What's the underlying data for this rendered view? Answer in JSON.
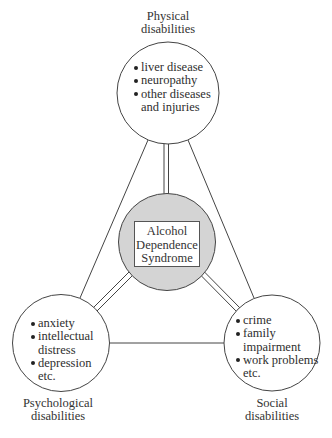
{
  "diagram": {
    "type": "relationship-diagram",
    "center": {
      "label_lines": [
        "Alcohol",
        "Dependence",
        "Syndrome"
      ],
      "fill_color": "#d4d4d4"
    },
    "nodes": [
      {
        "id": "physical",
        "title_lines": [
          "Physical",
          "disabilities"
        ],
        "items": [
          {
            "bullet": true,
            "text": "liver disease"
          },
          {
            "bullet": true,
            "text": "neuropathy"
          },
          {
            "bullet": true,
            "text": "other diseases"
          },
          {
            "bullet": false,
            "text": "and injuries"
          }
        ]
      },
      {
        "id": "psychological",
        "title_lines": [
          "Psychological",
          "disabilities"
        ],
        "items": [
          {
            "bullet": true,
            "text": "anxiety"
          },
          {
            "bullet": true,
            "text": "intellectual"
          },
          {
            "bullet": false,
            "text": "distress"
          },
          {
            "bullet": true,
            "text": "depression"
          },
          {
            "bullet": false,
            "text": "etc."
          }
        ]
      },
      {
        "id": "social",
        "title_lines": [
          "Social",
          "disabilities"
        ],
        "items": [
          {
            "bullet": true,
            "text": "crime"
          },
          {
            "bullet": true,
            "text": "family"
          },
          {
            "bullet": false,
            "text": "impairment"
          },
          {
            "bullet": true,
            "text": "work problems"
          },
          {
            "bullet": false,
            "text": "etc."
          }
        ]
      }
    ],
    "connections": [
      {
        "from": "center",
        "to": "physical",
        "style": "double"
      },
      {
        "from": "center",
        "to": "psychological",
        "style": "double"
      },
      {
        "from": "center",
        "to": "social",
        "style": "double"
      },
      {
        "from": "physical",
        "to": "psychological",
        "style": "single"
      },
      {
        "from": "physical",
        "to": "social",
        "style": "single"
      },
      {
        "from": "psychological",
        "to": "social",
        "style": "single"
      }
    ]
  }
}
